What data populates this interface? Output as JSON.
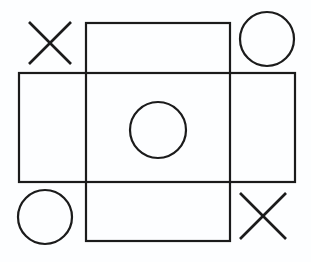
{
  "figure": {
    "background_color": "#fdfeff",
    "stroke_color": "#1b1b1b",
    "canvas": {
      "width": 311,
      "height": 262
    }
  },
  "grid": {
    "style": "two-overlapping-rectangles",
    "rectangles": [
      {
        "name": "vertical-rectangle",
        "x": 86,
        "y": 23,
        "width": 144,
        "height": 218,
        "stroke_width": 2.2
      },
      {
        "name": "horizontal-rectangle",
        "x": 19,
        "y": 73,
        "width": 276,
        "height": 109,
        "stroke_width": 2.2
      }
    ]
  },
  "marks": {
    "cells": [
      {
        "cell": "top-left",
        "row": 0,
        "col": 0,
        "mark": "X",
        "symbol_name": "x-mark",
        "center_x": 50,
        "center_y": 43,
        "half_size": 21,
        "stroke_width": 2.6
      },
      {
        "cell": "top-right",
        "row": 0,
        "col": 2,
        "mark": "O",
        "symbol_name": "o-mark",
        "center_x": 267,
        "center_y": 39,
        "radius": 27,
        "stroke_width": 2.2
      },
      {
        "cell": "middle-center",
        "row": 1,
        "col": 1,
        "mark": "O",
        "symbol_name": "o-mark",
        "center_x": 158,
        "center_y": 130,
        "radius": 28,
        "stroke_width": 2.2
      },
      {
        "cell": "bottom-left",
        "row": 2,
        "col": 0,
        "mark": "O",
        "symbol_name": "o-mark",
        "center_x": 45,
        "center_y": 217,
        "radius": 27,
        "stroke_width": 2.2
      },
      {
        "cell": "bottom-right",
        "row": 2,
        "col": 2,
        "mark": "X",
        "symbol_name": "x-mark",
        "center_x": 263,
        "center_y": 216,
        "half_size": 23,
        "stroke_width": 2.6
      }
    ],
    "empty_cells": [
      "top-center",
      "middle-left",
      "middle-right",
      "bottom-center"
    ],
    "x_count": 2,
    "o_count": 3
  }
}
